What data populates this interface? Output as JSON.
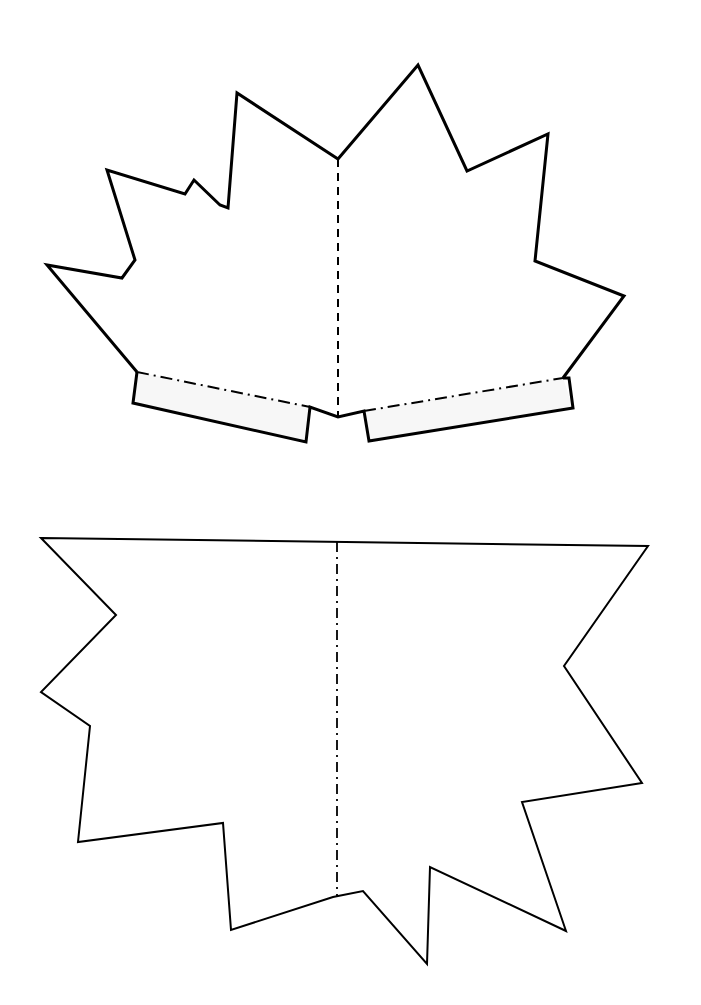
{
  "canvas": {
    "width": 701,
    "height": 1005,
    "background": "#ffffff"
  },
  "colors": {
    "stroke": "#000000",
    "tab_fill": "#f7f7f7",
    "fill": "#ffffff"
  },
  "top_piece": {
    "outline": [
      [
        137,
        372
      ],
      [
        47,
        265
      ],
      [
        122,
        278
      ],
      [
        135,
        260
      ],
      [
        107,
        170
      ],
      [
        185,
        194
      ],
      [
        194,
        180
      ],
      [
        220,
        205
      ],
      [
        228,
        208
      ],
      [
        237,
        93
      ],
      [
        338,
        159
      ],
      [
        418,
        65
      ],
      [
        467,
        171
      ],
      [
        548,
        134
      ],
      [
        535,
        261
      ],
      [
        624,
        296
      ],
      [
        563,
        378
      ],
      [
        563,
        378
      ],
      [
        569,
        378
      ],
      [
        573,
        408
      ],
      [
        369,
        441
      ],
      [
        364,
        411
      ],
      [
        338,
        417
      ],
      [
        313,
        410
      ],
      [
        306,
        442
      ],
      [
        133,
        403
      ]
    ],
    "body_outline": [
      [
        137,
        372
      ],
      [
        47,
        265
      ],
      [
        122,
        278
      ],
      [
        135,
        260
      ],
      [
        107,
        170
      ],
      [
        185,
        194
      ],
      [
        194,
        180
      ],
      [
        220,
        205
      ],
      [
        228,
        208
      ],
      [
        237,
        93
      ],
      [
        338,
        159
      ],
      [
        418,
        65
      ],
      [
        467,
        171
      ],
      [
        548,
        134
      ],
      [
        535,
        261
      ],
      [
        624,
        296
      ],
      [
        563,
        378
      ]
    ],
    "left_tab": [
      [
        137,
        372
      ],
      [
        310,
        407
      ],
      [
        306,
        442
      ],
      [
        133,
        403
      ]
    ],
    "right_tab": [
      [
        364,
        411
      ],
      [
        563,
        378
      ],
      [
        573,
        408
      ],
      [
        369,
        441
      ]
    ],
    "center_notch": [
      [
        310,
        407
      ],
      [
        338,
        417
      ],
      [
        364,
        411
      ]
    ],
    "fold_line": {
      "x1": 338,
      "y1": 159,
      "x2": 338,
      "y2": 417,
      "style": "dashed"
    },
    "left_tab_fold": {
      "x1": 137,
      "y1": 372,
      "x2": 310,
      "y2": 407,
      "style": "dash-dot"
    },
    "right_tab_fold": {
      "x1": 364,
      "y1": 411,
      "x2": 563,
      "y2": 378,
      "style": "dash-dot"
    },
    "stroke_width": 3
  },
  "bottom_piece": {
    "outline": [
      [
        41,
        538
      ],
      [
        648,
        546
      ],
      [
        564,
        666
      ],
      [
        642,
        783
      ],
      [
        522,
        802
      ],
      [
        566,
        931
      ],
      [
        430,
        867
      ],
      [
        427,
        964
      ],
      [
        363,
        891
      ],
      [
        333,
        897
      ],
      [
        231,
        930
      ],
      [
        223,
        823
      ],
      [
        78,
        842
      ],
      [
        90,
        726
      ],
      [
        41,
        692
      ],
      [
        116,
        615
      ]
    ],
    "fold_line": {
      "x1": 337,
      "y1": 542,
      "x2": 337,
      "y2": 897,
      "style": "dash-dot"
    },
    "stroke_width": 2
  }
}
